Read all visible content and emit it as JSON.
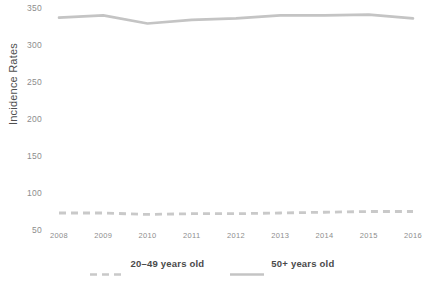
{
  "chart_data": {
    "type": "line",
    "title": "",
    "xlabel": "",
    "ylabel": "Incidence Rates",
    "categories": [
      "2008",
      "2009",
      "2010",
      "2011",
      "2012",
      "2013",
      "2014",
      "2015",
      "2016"
    ],
    "x": [
      2008,
      2009,
      2010,
      2011,
      2012,
      2013,
      2014,
      2015,
      2016
    ],
    "ylim": [
      50,
      350
    ],
    "yticks": [
      50,
      100,
      150,
      200,
      250,
      300,
      350
    ],
    "ytick_labels": [
      "50",
      "100",
      "150",
      "200",
      "250",
      "300",
      "350"
    ],
    "grid": false,
    "legend_position": "bottom",
    "series": [
      {
        "name": "20–49 years old",
        "style": "dashed",
        "color": "#c9c9c9",
        "values": [
          73,
          73,
          71,
          72,
          72,
          73,
          74,
          75,
          75
        ]
      },
      {
        "name": "50+ years old",
        "style": "solid",
        "color": "#c4c4c4",
        "values": [
          337,
          340,
          329,
          334,
          336,
          340,
          340,
          341,
          336
        ]
      }
    ]
  },
  "axis": {
    "y_title": "Incidence Rates"
  },
  "legend": {
    "items": [
      {
        "label": "20–49 years old",
        "style": "dashed",
        "color": "#c9c9c9"
      },
      {
        "label": "50+ years old",
        "style": "solid",
        "color": "#c4c4c4"
      }
    ]
  },
  "colors": {
    "series_20_49": "#c9c9c9",
    "series_50plus": "#c4c4c4",
    "tick_text": "#8d8d8d",
    "axis_title_text": "#4f4f4f",
    "legend_text": "#4a4a4a",
    "background": "#ffffff"
  }
}
